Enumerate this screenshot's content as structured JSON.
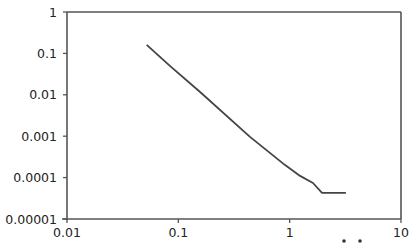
{
  "chart_data": {
    "type": "line",
    "title": "",
    "xlabel": "",
    "ylabel": "",
    "xscale": "log",
    "yscale": "log",
    "xlim": [
      0.01,
      10
    ],
    "ylim": [
      1e-05,
      1
    ],
    "grid": false,
    "legend": null,
    "x_ticks": [
      {
        "value": 0.01,
        "label": "0.01"
      },
      {
        "value": 0.1,
        "label": "0.1"
      },
      {
        "value": 1,
        "label": "1"
      },
      {
        "value": 10,
        "label": "10"
      }
    ],
    "y_ticks": [
      {
        "value": 1,
        "label": "1"
      },
      {
        "value": 0.1,
        "label": "0.1"
      },
      {
        "value": 0.01,
        "label": "0.01"
      },
      {
        "value": 0.001,
        "label": "0.001"
      },
      {
        "value": 0.0001,
        "label": "0.0001"
      },
      {
        "value": 1e-05,
        "label": "0.00001"
      }
    ],
    "series": [
      {
        "name": "series-1",
        "color": "#444444",
        "x": [
          0.052,
          0.084,
          0.157,
          0.44,
          0.91,
          1.24,
          1.62,
          1.95,
          3.2
        ],
        "y": [
          0.16,
          0.05,
          0.0117,
          0.00096,
          0.0002,
          0.00011,
          7.4e-05,
          4.3e-05,
          4.3e-05
        ]
      }
    ],
    "annotations": [
      {
        "text": "• •",
        "note": "clipped label fragment below x-axis"
      }
    ]
  }
}
